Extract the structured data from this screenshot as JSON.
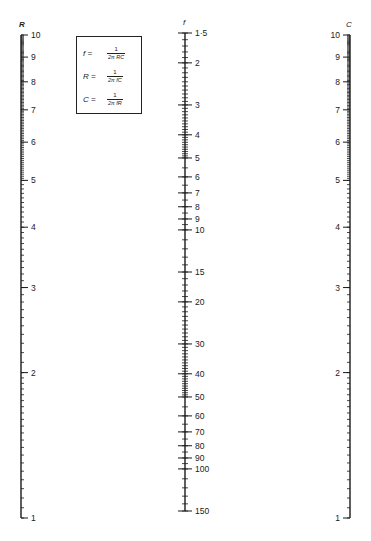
{
  "formulas": [
    {
      "lhs": "f =",
      "num": "1",
      "den": "2π RC"
    },
    {
      "lhs": "R =",
      "num": "1",
      "den": "2π fC"
    },
    {
      "lhs": "C =",
      "num": "1",
      "den": "2π fR"
    }
  ],
  "scales": {
    "R": {
      "label": "R",
      "axis_x": 21,
      "y_at_min": 518,
      "y_at_max": 35,
      "min": 1,
      "max": 10,
      "tick_side": "right",
      "label_side": "right",
      "major_labels": [
        "1",
        "2",
        "3",
        "4",
        "5",
        "6",
        "7",
        "8",
        "9",
        "10"
      ]
    },
    "f": {
      "label": "f",
      "axis_x": 185,
      "y_at_min": 33,
      "y_at_max": 511,
      "min": 1.5,
      "max": 150,
      "tick_side": "both",
      "label_side": "right",
      "major_labels": [
        "1·5",
        "2",
        "3",
        "4",
        "5",
        "6",
        "7",
        "8",
        "9",
        "10",
        "15",
        "20",
        "30",
        "40",
        "50",
        "60",
        "70",
        "80",
        "90",
        "100",
        "150"
      ]
    },
    "C": {
      "label": "C",
      "axis_x": 350,
      "y_at_min": 518,
      "y_at_max": 35,
      "min": 1,
      "max": 10,
      "tick_side": "left",
      "label_side": "left",
      "major_labels": [
        "1",
        "2",
        "3",
        "4",
        "5",
        "6",
        "7",
        "8",
        "9",
        "10"
      ]
    }
  },
  "colors": {
    "ink": "#1a1a1a",
    "background": "#ffffff"
  }
}
